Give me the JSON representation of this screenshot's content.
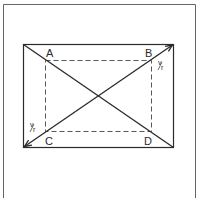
{
  "diagram": {
    "type": "geometry",
    "colors": {
      "stroke": "#2a2a2a",
      "frame": "#555555",
      "dashed": "#444444",
      "background": "#ffffff"
    },
    "outer_frame": {
      "x": 3,
      "y": 4,
      "right": 195,
      "bottom_open": true
    },
    "outer_rect": {
      "x": 23,
      "y": 44,
      "width": 150,
      "height": 103
    },
    "inner_dashed_rect": {
      "x": 45,
      "y": 60,
      "width": 106,
      "height": 71
    },
    "labels": {
      "A": "A",
      "B": "B",
      "C": "C",
      "D": "D"
    },
    "annotations": {
      "top_right": {
        "num": "v",
        "den": "r"
      },
      "bottom_left": {
        "num": "v",
        "den": "r"
      }
    },
    "lines": [
      {
        "name": "diagonal-top-left-to-bottom-right",
        "from": [
          23,
          44
        ],
        "to": [
          173,
          147
        ],
        "arrows": "none"
      },
      {
        "name": "diagonal-bottom-left-to-top-right",
        "from": [
          23,
          147
        ],
        "to": [
          173,
          44
        ],
        "arrows": "both"
      }
    ]
  }
}
